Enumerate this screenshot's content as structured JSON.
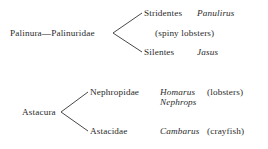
{
  "figure": {
    "type": "cladogram",
    "background_color": "#ffffff",
    "line_color": "#333333"
  },
  "clades": [
    {
      "id": "palinura",
      "root_label": "Palinura—Palinuridae",
      "branches": [
        {
          "taxon": "Stridentes",
          "genus": "Panulirus",
          "common_name": "(spiny lobsters)"
        },
        {
          "taxon": "Silentes",
          "genus": "Jasus",
          "common_name": ""
        }
      ]
    },
    {
      "id": "astacura",
      "root_label": "Astacura",
      "branches": [
        {
          "taxon": "Nephropidae",
          "genus": "Homarus",
          "genus_2": "Nephrops",
          "common_name": "(lobsters)"
        },
        {
          "taxon": "Astacidae",
          "genus": "Cambarus",
          "common_name": "(crayfish)"
        }
      ]
    }
  ]
}
